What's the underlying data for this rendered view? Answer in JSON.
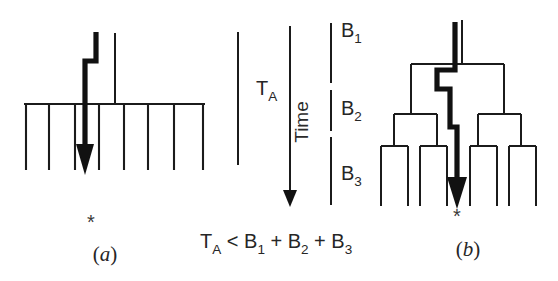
{
  "figure": {
    "caption_a": "(a)",
    "caption_b": "(b)",
    "marker_a": "*",
    "marker_b": "*",
    "background_color": "#ffffff",
    "ink_color": "#1b1b1b",
    "skew_path_color": "#111111"
  },
  "panel_a": {
    "name": "single-driver-clock-net",
    "bus_x_start": 24,
    "bus_x_end": 205,
    "bus_y": 104,
    "stub_count": 8,
    "stub_x": [
      26,
      49,
      75,
      99,
      124,
      148,
      174,
      203
    ],
    "stub_y_bottom": 170,
    "thin_stem_x": 115,
    "thin_stem_y_top": 33,
    "thin_stem_y_bottom": 104,
    "skew_path_points": "96,32 96,61 85,61 85,146",
    "arrow_tip_y": 175
  },
  "panel_time": {
    "ta_label": "T",
    "ta_sub": "A",
    "ta_line_x": 238,
    "ta_line_y_top": 32,
    "ta_line_y_bottom": 165,
    "ta_label_x": 256,
    "ta_label_y": 95,
    "time_label": "Time",
    "time_axis_x": 290,
    "time_axis_y_top": 26,
    "time_axis_y_bottom": 198,
    "time_label_x": 308,
    "time_label_y": 120,
    "b_line_x": 331,
    "b_segments": [
      {
        "label": "B",
        "sub": "1",
        "y_top": 23,
        "y_bottom": 83,
        "label_x": 341,
        "label_y": 37
      },
      {
        "label": "B",
        "sub": "2",
        "y_top": 90,
        "y_bottom": 131,
        "label_x": 341,
        "label_y": 115
      },
      {
        "label": "B",
        "sub": "3",
        "y_top": 137,
        "y_bottom": 205,
        "label_x": 341,
        "label_y": 180
      }
    ]
  },
  "formula": {
    "text_parts": [
      "T",
      "A",
      " < ",
      "B",
      "1",
      " + ",
      "B",
      "2",
      " + ",
      "B",
      "3"
    ],
    "full_text": "TA < B1 + B2 + B3",
    "x": 200,
    "y": 248
  },
  "panel_b": {
    "name": "balanced-h-tree-clock-net",
    "root_stem_x": 457,
    "root_stem_y_top": 20,
    "root_stem_y_bottom": 64,
    "level1_y": 64,
    "level1_left_x": 411,
    "level1_right_x": 504,
    "level1_drop_y": 114,
    "level2_left_y": 114,
    "level2_left_span": [
      394,
      437
    ],
    "level2_right_span": [
      478,
      521
    ],
    "level2_drop_y": 146,
    "leaf_y": 146,
    "leaf_y_bottom": 206,
    "leaf_x": [
      381,
      408,
      420,
      447,
      470,
      497,
      509,
      536
    ],
    "leaf_groups": [
      {
        "span": [
          381,
          408
        ]
      },
      {
        "span": [
          420,
          447
        ]
      },
      {
        "span": [
          470,
          497
        ]
      },
      {
        "span": [
          509,
          536
        ]
      }
    ],
    "skew_path_points": "457,22 457,71 441,71 441,88 451,88 451,125 457,125 457,180",
    "arrow_tip_y": 209
  },
  "labels": {
    "caption_a_x": 105,
    "caption_a_y": 261,
    "caption_b_x": 468,
    "caption_b_y": 256,
    "star_a_x": 91,
    "star_a_y": 229,
    "star_b_x": 457,
    "star_b_y": 223
  }
}
